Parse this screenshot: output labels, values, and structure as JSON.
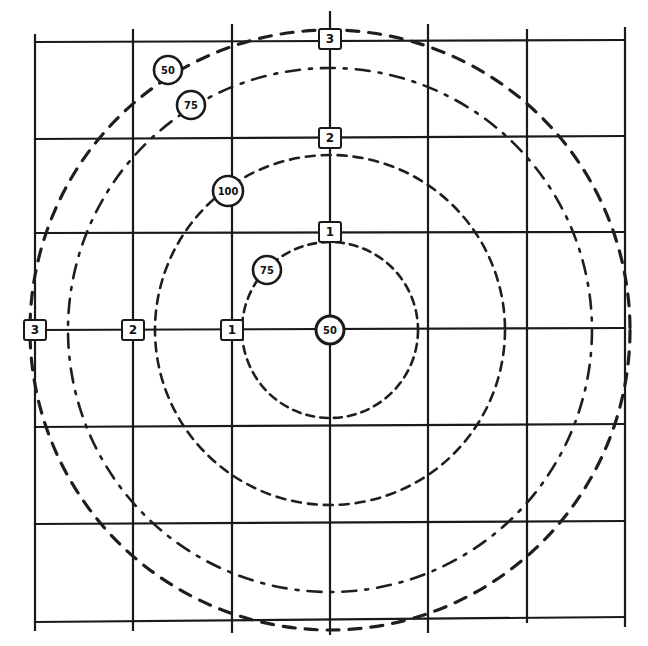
{
  "diagram": {
    "background": "#ffffff",
    "line_color": "#1a1a1a",
    "grid": {
      "x_lines": [
        35,
        133,
        232,
        330,
        428,
        527,
        625
      ],
      "y_lines": [
        40,
        138,
        232,
        328,
        426,
        524,
        622
      ]
    },
    "center": {
      "x": 330,
      "y": 328,
      "label": "50"
    },
    "vertical_axis_markers": [
      {
        "label": "3",
        "x": 330,
        "y": 40
      },
      {
        "label": "2",
        "x": 330,
        "y": 138
      },
      {
        "label": "1",
        "x": 330,
        "y": 232
      }
    ],
    "horizontal_axis_markers": [
      {
        "label": "3",
        "x": 35,
        "y": 330
      },
      {
        "label": "2",
        "x": 133,
        "y": 330
      },
      {
        "label": "1",
        "x": 232,
        "y": 330
      }
    ],
    "contours": [
      {
        "value": "50",
        "radius": 300,
        "label_x": 168,
        "label_y": 70
      },
      {
        "value": "75",
        "radius": 262,
        "label_x": 191,
        "label_y": 105
      },
      {
        "value": "100",
        "radius": 175,
        "label_x": 228,
        "label_y": 191
      },
      {
        "value": "75",
        "radius": 88,
        "label_x": 267,
        "label_y": 270
      }
    ]
  }
}
